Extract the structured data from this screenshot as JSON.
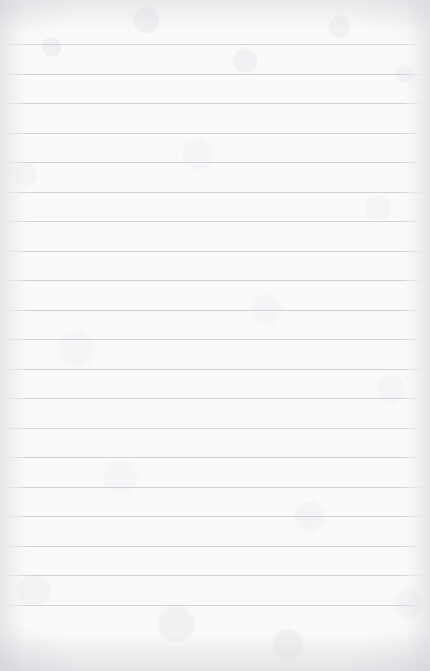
{
  "document": {
    "kind": "lined-notepaper",
    "description": "Blank ruled writing paper",
    "written_text": "",
    "page_width": 430,
    "page_height": 671
  },
  "paper": {
    "background_color": "#fbfbfb",
    "edge_shade_color": "#d6d8db",
    "texture": "mottled-fibrous-grain"
  },
  "ruling": {
    "line_color": "#c9cdd3",
    "line_thickness": 1,
    "line_spacing": 29.5,
    "first_line_y": 44,
    "line_left_x": 5,
    "line_right_x": 423,
    "line_count": 20,
    "lines_y": [
      44,
      73.5,
      103,
      132.5,
      162,
      191.5,
      221,
      250.5,
      280,
      309.5,
      339,
      368.5,
      398,
      427.5,
      457,
      486.5,
      516,
      545.5,
      575,
      604.5
    ]
  }
}
